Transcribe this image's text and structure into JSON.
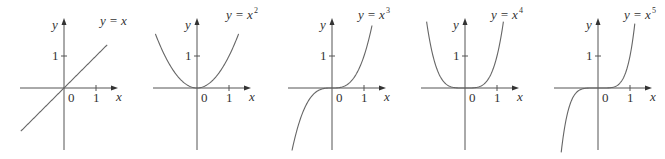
{
  "figure": {
    "background": "#ffffff",
    "axis_color": "#555555",
    "curve_color": "#666666"
  },
  "chart_data": [
    {
      "type": "line",
      "title": "y = x",
      "label_base": "y = x",
      "exponent": 1,
      "exponent_label": "",
      "xlabel": "x",
      "ylabel": "y",
      "ticks": {
        "x": [
          "0",
          "1"
        ],
        "y": [
          "1"
        ]
      },
      "origin": [
        64,
        88
      ],
      "unit": 32,
      "x_range": [
        -1.35,
        1.35
      ],
      "ylim": [
        -1.9,
        2.4
      ],
      "label_pos": [
        100,
        25
      ],
      "points": [
        [
          -1.35,
          -1.35
        ],
        [
          0,
          0
        ],
        [
          1.35,
          1.35
        ]
      ]
    },
    {
      "type": "line",
      "title": "y = x^2",
      "label_base": "y = x",
      "exponent": 2,
      "exponent_label": "2",
      "xlabel": "x",
      "ylabel": "y",
      "ticks": {
        "x": [
          "0",
          "1"
        ],
        "y": [
          "1"
        ]
      },
      "origin": [
        197,
        88
      ],
      "unit": 32,
      "x_range": [
        -1.3,
        1.3
      ],
      "ylim": [
        -1.9,
        2.4
      ],
      "label_pos": [
        226,
        19
      ],
      "points": [
        [
          -1.3,
          1.69
        ],
        [
          -1,
          1
        ],
        [
          -0.5,
          0.25
        ],
        [
          0,
          0
        ],
        [
          0.5,
          0.25
        ],
        [
          1,
          1
        ],
        [
          1.3,
          1.69
        ]
      ]
    },
    {
      "type": "line",
      "title": "y = x^3",
      "label_base": "y = x",
      "exponent": 3,
      "exponent_label": "3",
      "xlabel": "x",
      "ylabel": "y",
      "ticks": {
        "x": [
          "0",
          "1"
        ],
        "y": [
          "1"
        ]
      },
      "origin": [
        332,
        88
      ],
      "unit": 32,
      "x_range": [
        -1.25,
        1.25
      ],
      "ylim": [
        -1.9,
        2.4
      ],
      "label_pos": [
        358,
        19
      ],
      "points": [
        [
          -1.25,
          -1.95
        ],
        [
          -1,
          -1
        ],
        [
          -0.5,
          -0.125
        ],
        [
          0,
          0
        ],
        [
          0.5,
          0.125
        ],
        [
          1,
          1
        ],
        [
          1.25,
          1.95
        ]
      ]
    },
    {
      "type": "line",
      "title": "y = x^4",
      "label_base": "y = x",
      "exponent": 4,
      "exponent_label": "4",
      "xlabel": "x",
      "ylabel": "y",
      "ticks": {
        "x": [
          "0",
          "1"
        ],
        "y": [
          "1"
        ]
      },
      "origin": [
        465,
        88
      ],
      "unit": 32,
      "x_range": [
        -1.2,
        1.2
      ],
      "ylim": [
        -1.9,
        2.4
      ],
      "label_pos": [
        491,
        19
      ],
      "points": [
        [
          -1.2,
          2.07
        ],
        [
          -1,
          1
        ],
        [
          -0.5,
          0.0625
        ],
        [
          0,
          0
        ],
        [
          0.5,
          0.0625
        ],
        [
          1,
          1
        ],
        [
          1.2,
          2.07
        ]
      ]
    },
    {
      "type": "line",
      "title": "y = x^5",
      "label_base": "y = x",
      "exponent": 5,
      "exponent_label": "5",
      "xlabel": "x",
      "ylabel": "y",
      "ticks": {
        "x": [
          "0",
          "1"
        ],
        "y": [
          "1"
        ]
      },
      "origin": [
        598,
        88
      ],
      "unit": 32,
      "x_range": [
        -1.15,
        1.15
      ],
      "ylim": [
        -1.9,
        2.4
      ],
      "label_pos": [
        624,
        19
      ],
      "points": [
        [
          -1.15,
          -2.01
        ],
        [
          -1,
          -1
        ],
        [
          -0.5,
          -0.031
        ],
        [
          0,
          0
        ],
        [
          0.5,
          0.031
        ],
        [
          1,
          1
        ],
        [
          1.15,
          2.01
        ]
      ]
    }
  ]
}
